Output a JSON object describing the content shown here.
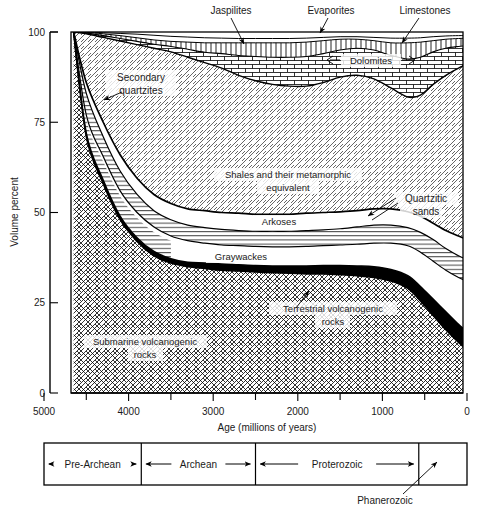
{
  "figure": {
    "y_axis": {
      "title": "Volume percent",
      "ticks": [
        0,
        25,
        50,
        75,
        100
      ],
      "tick_labels": [
        "0",
        "25",
        "50",
        "75",
        "100"
      ],
      "range": [
        0,
        100
      ]
    },
    "x_axis": {
      "title": "Age (millions of years)",
      "ticks": [
        5000,
        4000,
        3000,
        2000,
        1000,
        0
      ],
      "tick_labels": [
        "5000",
        "4000",
        "3000",
        "2000",
        "1000",
        "0"
      ],
      "minor_ticks": [
        4500,
        3500,
        2500,
        1500,
        500
      ],
      "range": [
        5000,
        0
      ],
      "plot_left_age": 4650
    },
    "callout_labels": [
      {
        "name": "jaspilites",
        "text": "Jaspilites"
      },
      {
        "name": "evaporites",
        "text": "Evaporites"
      },
      {
        "name": "limestones",
        "text": "Limestones"
      },
      {
        "name": "dolomites",
        "text": "Dolomites"
      },
      {
        "name": "secondary-quartzites",
        "text": "Secondary\nquartzites"
      },
      {
        "name": "quartzitic-sands",
        "text": "Quartzitic\nsands"
      }
    ],
    "label_texts": {
      "jaspilites": "Jaspilites",
      "evaporites": "Evaporites",
      "limestones": "Limestones",
      "dolomites": "Dolomites",
      "secondary_quartzites_l1": "Secondary",
      "secondary_quartzites_l2": "quartzites",
      "quartzitic_sands_l1": "Quartzitic",
      "quartzitic_sands_l2": "sands",
      "shales_l1": "Shales and their metamorphic",
      "shales_l2": "equivalent",
      "arkoses": "Arkoses",
      "graywackes": "Graywackes",
      "submarine_l1": "Submarine volcanogenic",
      "submarine_l2": "rocks",
      "terrestrial_l1": "Terrestrial volcanogenic",
      "terrestrial_l2": "rocks"
    },
    "timeline": {
      "eras": [
        {
          "name": "pre-archean",
          "label": "Pre-Archean",
          "start_age": 5000,
          "end_age": 3850,
          "arrows": "both"
        },
        {
          "name": "archean",
          "label": "Archean",
          "start_age": 3850,
          "end_age": 2500,
          "arrows": "both"
        },
        {
          "name": "proterozoic",
          "label": "Proterozoic",
          "start_age": 2500,
          "end_age": 570,
          "arrows": "both"
        },
        {
          "name": "phanerozoic",
          "label": "Phanerozoic",
          "start_age": 570,
          "end_age": 0,
          "arrows": "callout"
        }
      ],
      "callout_label": "Phanerozoic"
    },
    "colors": {
      "ink": "#000000",
      "background": "#ffffff",
      "terrestrial_band": "#000000"
    }
  },
  "chart_data": {
    "type": "area",
    "subtype": "stacked-area-cumulative-boundaries",
    "title": "",
    "xlabel": "Age (millions of years)",
    "ylabel": "Volume percent",
    "xlim": [
      5000,
      0
    ],
    "ylim": [
      0,
      100
    ],
    "grid": false,
    "legend": "in-place region labels",
    "x": [
      4650,
      4500,
      4300,
      4100,
      3900,
      3700,
      3500,
      3300,
      3100,
      2900,
      2700,
      2500,
      2300,
      2100,
      1900,
      1700,
      1500,
      1300,
      1100,
      900,
      700,
      550,
      400,
      250,
      100,
      0
    ],
    "note": "Values are cumulative upper boundaries of each stacked band, in volume percent.",
    "series": [
      {
        "name": "Submarine volcanogenic rocks",
        "pattern": "cross-hatch",
        "boundary_upper": [
          100,
          71,
          58,
          48,
          42,
          38,
          36,
          35,
          34.5,
          34,
          33.8,
          33.5,
          33.3,
          33.2,
          33,
          33,
          32.8,
          32.5,
          32,
          31,
          29,
          25.5,
          21.5,
          17.5,
          14,
          12
        ]
      },
      {
        "name": "Terrestrial volcanogenic rocks",
        "pattern": "solid-black",
        "boundary_upper": [
          100,
          72,
          59,
          49,
          43,
          39.2,
          37.2,
          36.2,
          36,
          35.7,
          35.5,
          35.3,
          35.2,
          35.2,
          35.2,
          35.3,
          35.3,
          35.2,
          35,
          34.2,
          32.5,
          29.5,
          26,
          22.5,
          19,
          17
        ]
      },
      {
        "name": "Graywackes",
        "pattern": "plain-white",
        "boundary_upper": [
          100,
          77,
          65.5,
          56,
          50,
          46,
          43.5,
          42.2,
          41.5,
          41,
          40.8,
          40.6,
          40.5,
          40.5,
          40.6,
          40.8,
          41,
          41.2,
          41.5,
          41.5,
          40.8,
          39,
          36.5,
          34,
          32,
          31
        ]
      },
      {
        "name": "Arkoses",
        "pattern": "horizontal-lines",
        "boundary_upper": [
          100,
          83,
          71,
          61.5,
          55,
          50.5,
          48,
          46.5,
          45.8,
          45.3,
          45,
          44.8,
          44.8,
          44.8,
          45,
          45.2,
          45.5,
          46,
          46.5,
          46.5,
          45.8,
          44.5,
          42.5,
          40,
          38,
          37
        ]
      },
      {
        "name": "Quartzitic sands",
        "pattern": "plain-white-thin",
        "boundary_upper": [
          100,
          86,
          75,
          66,
          59.5,
          55,
          52.5,
          51,
          50.5,
          50,
          49.8,
          49.5,
          49.5,
          49.5,
          49.8,
          50,
          50.2,
          50.5,
          51,
          51,
          50.2,
          49,
          47,
          45,
          43.5,
          42.5
        ]
      },
      {
        "name": "Shales and their metamorphic equivalent",
        "pattern": "diagonal-hatch-right",
        "boundary_upper": [
          100,
          99.5,
          98.5,
          97.5,
          96.5,
          95.5,
          94.5,
          93,
          91.5,
          90,
          88,
          86.5,
          85.5,
          85,
          85,
          86,
          87.5,
          88,
          87,
          84.5,
          82,
          82.5,
          85.5,
          88,
          90,
          91
        ]
      },
      {
        "name": "Dolomites",
        "pattern": "brick",
        "boundary_upper": [
          100,
          99.7,
          99,
          98.2,
          97.4,
          96.6,
          96,
          95.2,
          94.4,
          94,
          93.5,
          93.2,
          93,
          93,
          93.2,
          94,
          95,
          95.5,
          95,
          93.5,
          92.5,
          93,
          94.5,
          95.5,
          96,
          96.2
        ]
      },
      {
        "name": "Jaspilites",
        "pattern": "vertical-lines",
        "boundary_upper": [
          100,
          99.9,
          99.5,
          99,
          98.4,
          97.8,
          97.4,
          97.2,
          97,
          97,
          97,
          97,
          97,
          97,
          97.2,
          97.6,
          98,
          98,
          97.6,
          97,
          97,
          97.2,
          97.6,
          98,
          98.2,
          98.3
        ]
      },
      {
        "name": "Evaporites",
        "pattern": "thin-strip",
        "boundary_upper": [
          100,
          100,
          99.8,
          99.6,
          99.4,
          99.1,
          98.8,
          98.6,
          98.4,
          98.3,
          98.2,
          98.2,
          98.2,
          98.2,
          98.3,
          98.5,
          98.7,
          98.7,
          98.5,
          98.3,
          98.3,
          98.4,
          98.7,
          98.9,
          99,
          99
        ]
      },
      {
        "name": "Limestones",
        "pattern": "thin-strip-top",
        "boundary_upper": [
          100,
          100,
          100,
          100,
          100,
          100,
          100,
          100,
          100,
          100,
          100,
          100,
          100,
          100,
          100,
          100,
          100,
          100,
          100,
          100,
          100,
          100,
          100,
          100,
          100,
          100
        ]
      },
      {
        "name": "Secondary quartzites",
        "pattern": "horizontal-lines",
        "note": "Narrow wedge present only near left edge (4650-3500 Ma) between submarine volcanogenic and graywackes boundaries"
      }
    ]
  }
}
